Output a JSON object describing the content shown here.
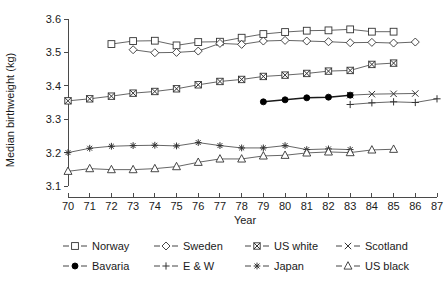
{
  "chart_data": {
    "type": "line",
    "title": "",
    "xlabel": "Year",
    "ylabel": "Median birthweight (kg)",
    "xlim": [
      70,
      87
    ],
    "ylim": [
      3.1,
      3.6
    ],
    "grid": false,
    "legend_position": "bottom",
    "x_ticks": [
      "70",
      "71",
      "72",
      "73",
      "74",
      "75",
      "76",
      "77",
      "78",
      "79",
      "80",
      "81",
      "82",
      "83",
      "84",
      "85",
      "86",
      "87"
    ],
    "y_ticks": [
      "3.1",
      "3.2",
      "3.3",
      "3.4",
      "3.5",
      "3.6"
    ],
    "series": [
      {
        "name": "Norway",
        "marker": "open-square",
        "x": [
          72,
          73,
          74,
          75,
          76,
          77,
          78,
          79,
          80,
          81,
          82,
          83,
          84,
          85
        ],
        "values": [
          3.525,
          3.534,
          3.535,
          3.521,
          3.531,
          3.532,
          3.544,
          3.555,
          3.561,
          3.565,
          3.566,
          3.569,
          3.562,
          3.562
        ]
      },
      {
        "name": "Sweden",
        "marker": "open-diamond",
        "x": [
          73,
          74,
          75,
          76,
          77,
          78,
          79,
          80,
          81,
          82,
          83,
          84,
          85,
          86
        ],
        "values": [
          3.508,
          3.499,
          3.5,
          3.504,
          3.527,
          3.524,
          3.534,
          3.536,
          3.534,
          3.532,
          3.529,
          3.53,
          3.528,
          3.531
        ]
      },
      {
        "name": "US white",
        "marker": "crossed-square",
        "x": [
          70,
          71,
          72,
          73,
          74,
          75,
          76,
          77,
          78,
          79,
          80,
          81,
          82,
          83,
          84,
          85
        ],
        "values": [
          3.355,
          3.361,
          3.369,
          3.378,
          3.383,
          3.391,
          3.403,
          3.413,
          3.419,
          3.428,
          3.432,
          3.437,
          3.444,
          3.446,
          3.464,
          3.468
        ]
      },
      {
        "name": "Scotland",
        "marker": "x-cross",
        "x": [
          83,
          84,
          85,
          86
        ],
        "values": [
          3.372,
          3.375,
          3.376,
          3.377
        ]
      },
      {
        "name": "Bavaria",
        "marker": "filled-circle",
        "x": [
          79,
          80,
          81,
          82,
          83
        ],
        "values": [
          3.352,
          3.358,
          3.364,
          3.366,
          3.372
        ]
      },
      {
        "name": "E & W",
        "marker": "plus",
        "x": [
          83,
          84,
          85,
          86,
          87
        ],
        "values": [
          3.344,
          3.349,
          3.352,
          3.35,
          3.361
        ]
      },
      {
        "name": "Japan",
        "marker": "asterisk",
        "x": [
          70,
          71,
          72,
          73,
          74,
          75,
          76,
          77,
          78,
          79,
          80,
          81,
          82,
          83
        ],
        "values": [
          3.2,
          3.213,
          3.219,
          3.221,
          3.222,
          3.22,
          3.23,
          3.221,
          3.214,
          3.214,
          3.221,
          3.209,
          3.211,
          3.209
        ]
      },
      {
        "name": "US black",
        "marker": "open-triangle",
        "x": [
          70,
          71,
          72,
          73,
          74,
          75,
          76,
          77,
          78,
          79,
          80,
          81,
          82,
          83,
          84,
          85
        ],
        "values": [
          3.144,
          3.152,
          3.149,
          3.149,
          3.152,
          3.158,
          3.171,
          3.181,
          3.181,
          3.19,
          3.192,
          3.199,
          3.202,
          3.2,
          3.208,
          3.21
        ]
      }
    ],
    "legend": [
      {
        "label": "Norway",
        "marker": "open-square"
      },
      {
        "label": "Sweden",
        "marker": "open-diamond"
      },
      {
        "label": "US white",
        "marker": "crossed-square"
      },
      {
        "label": "Scotland",
        "marker": "x-cross"
      },
      {
        "label": "Bavaria",
        "marker": "filled-circle"
      },
      {
        "label": "E & W",
        "marker": "plus"
      },
      {
        "label": "Japan",
        "marker": "asterisk"
      },
      {
        "label": "US black",
        "marker": "open-triangle"
      }
    ],
    "colors": {
      "line": "#555555",
      "marker_stroke": "#333333",
      "marker_fill": "#ffffff",
      "axis": "#4a4a4a",
      "text": "#1a1a1a",
      "background": "#ffffff"
    }
  }
}
